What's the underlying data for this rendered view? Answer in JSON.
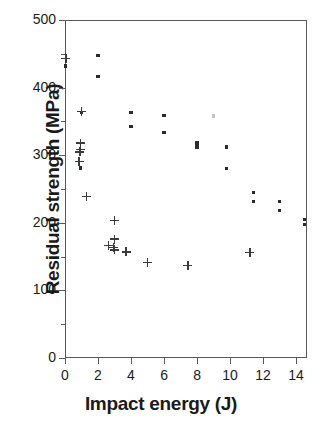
{
  "chart_data": {
    "type": "scatter",
    "title": "",
    "xlabel": "Impact energy (J)",
    "ylabel": "Residual strength (MPa)",
    "xlim": [
      0,
      14.6
    ],
    "ylim": [
      0,
      500
    ],
    "xticks": [
      0,
      2,
      4,
      6,
      8,
      10,
      12,
      14
    ],
    "xtick_labels": [
      "0",
      "2",
      "4",
      "6",
      "8",
      "10",
      "12",
      "14"
    ],
    "yticks": [
      0,
      100,
      200,
      300,
      400,
      500
    ],
    "ytick_labels": [
      "0",
      "100",
      "200",
      "300",
      "400",
      "500"
    ],
    "y_minor_ticks": [
      50,
      150,
      250,
      350,
      450
    ],
    "grid": false,
    "legend": null,
    "series": [
      {
        "name": "square-markers",
        "marker": "square",
        "color": "#2a2a2a",
        "points": [
          [
            0.05,
            432
          ],
          [
            2.0,
            447
          ],
          [
            2.0,
            416
          ],
          [
            1.0,
            363
          ],
          [
            4.0,
            363
          ],
          [
            4.0,
            342
          ],
          [
            6.0,
            359
          ],
          [
            6.0,
            334
          ],
          [
            8.0,
            318
          ],
          [
            8.0,
            312
          ],
          [
            9.0,
            358
          ],
          [
            9.8,
            312
          ],
          [
            9.8,
            280
          ],
          [
            0.95,
            281
          ],
          [
            11.4,
            245
          ],
          [
            11.4,
            231
          ],
          [
            13.0,
            231
          ],
          [
            13.0,
            218
          ],
          [
            14.5,
            205
          ],
          [
            14.5,
            197
          ]
        ]
      },
      {
        "name": "plus-markers",
        "marker": "plus",
        "color": "#3a3a3a",
        "points": [
          [
            0.05,
            443
          ],
          [
            1.0,
            365
          ],
          [
            0.95,
            318
          ],
          [
            0.95,
            308
          ],
          [
            0.9,
            305
          ],
          [
            0.85,
            291
          ],
          [
            1.3,
            239
          ],
          [
            3.0,
            203
          ],
          [
            3.0,
            176
          ],
          [
            2.65,
            166
          ],
          [
            2.95,
            163
          ],
          [
            3.0,
            160
          ],
          [
            3.7,
            157
          ],
          [
            5.0,
            141
          ],
          [
            7.45,
            137
          ],
          [
            11.2,
            156
          ]
        ]
      }
    ]
  },
  "axis": {
    "y_label_text": "Residual strength (MPa)",
    "x_label_text": "Impact energy (J)"
  }
}
